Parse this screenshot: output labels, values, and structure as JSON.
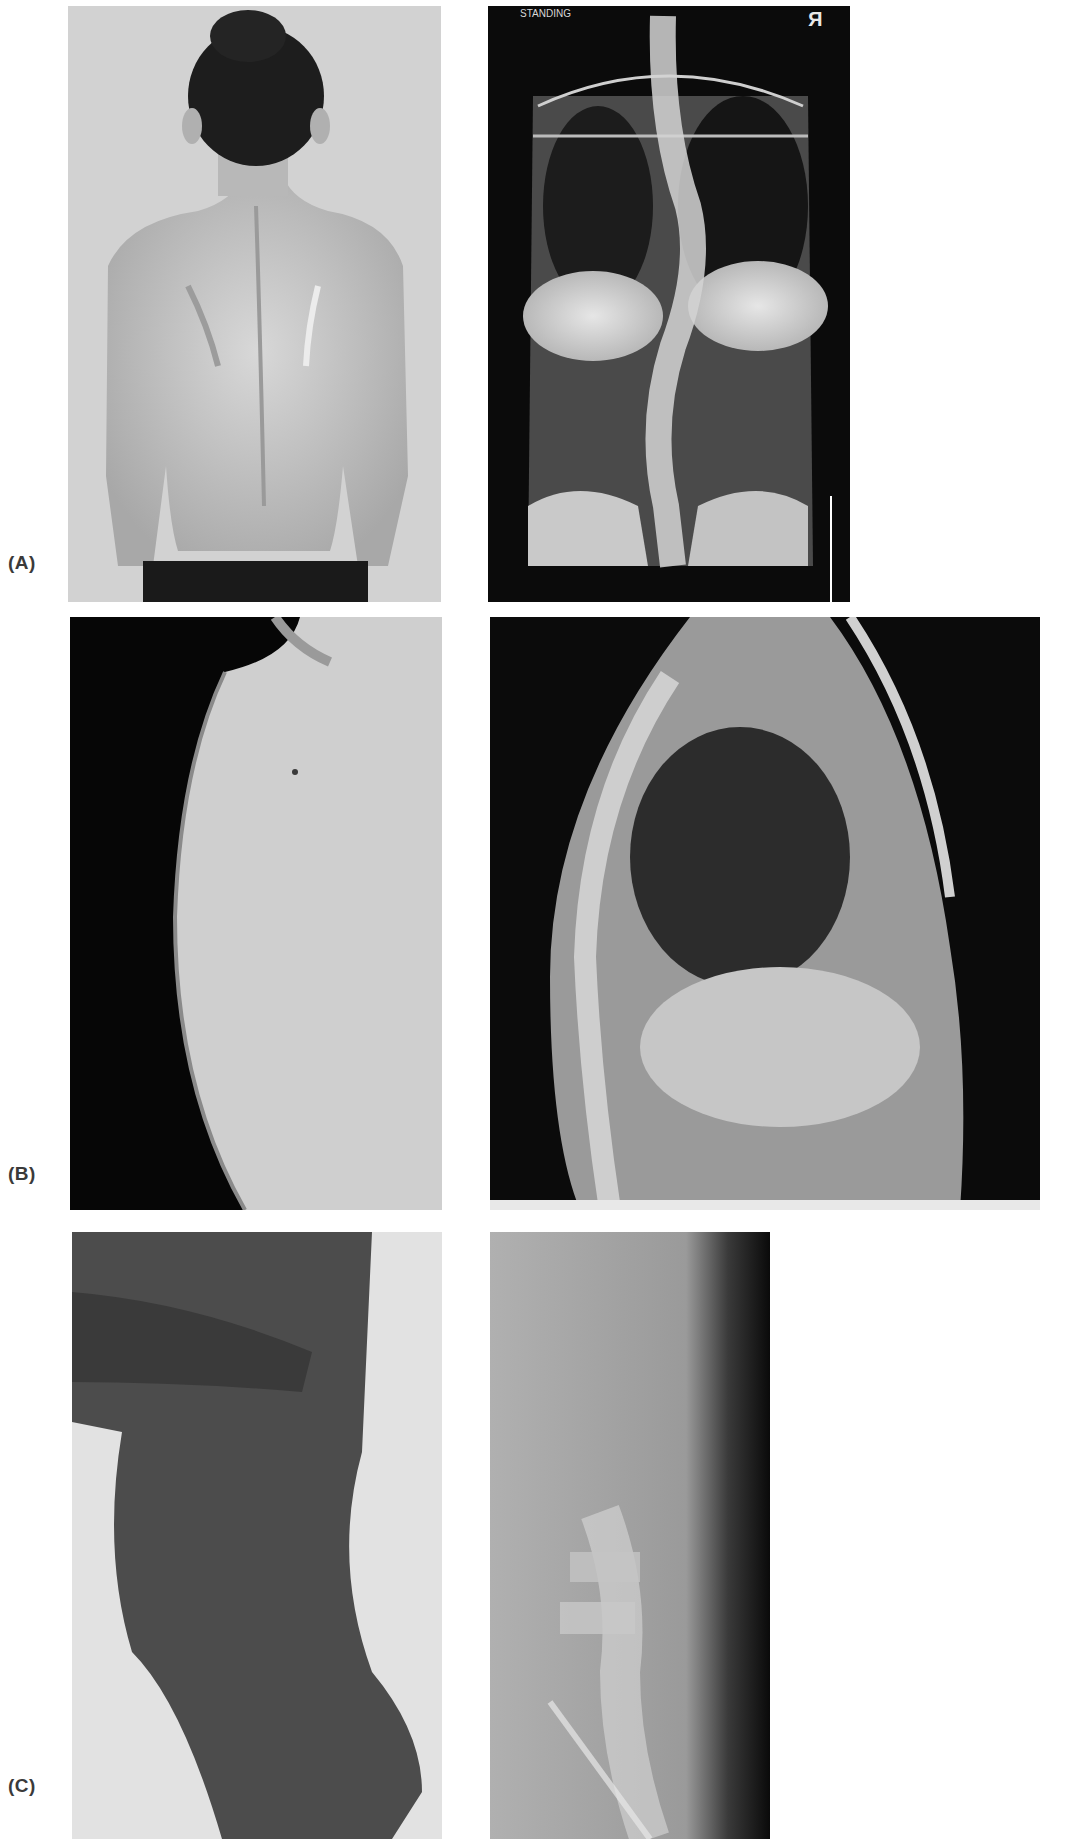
{
  "figure": {
    "rows": [
      {
        "label": "(A)",
        "left_panel": {
          "name": "standing-back-photo"
        },
        "right_panel": {
          "name": "ap-standing-radiograph",
          "annotations": {
            "view_text": "STANDING",
            "side_marker": "R"
          }
        }
      },
      {
        "label": "(B)",
        "left_panel": {
          "name": "kyphosis-side-photo"
        },
        "right_panel": {
          "name": "lateral-thoracic-radiograph"
        }
      },
      {
        "label": "(C)",
        "left_panel": {
          "name": "lordosis-side-photo"
        },
        "right_panel": {
          "name": "lateral-lumbar-radiograph"
        }
      }
    ]
  }
}
